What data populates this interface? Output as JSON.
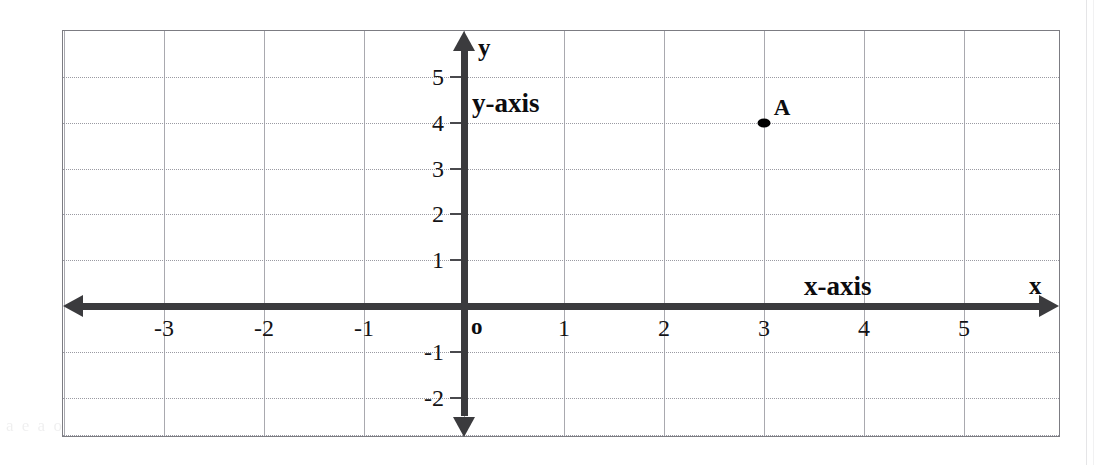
{
  "chart_data": {
    "type": "scatter",
    "title": "",
    "xlabel": "x-axis",
    "ylabel": "y-axis",
    "x_axis_letter": "x",
    "y_axis_letter": "y",
    "origin_label": "o",
    "xlim": [
      -4,
      5.9
    ],
    "ylim": [
      -2.85,
      5.9
    ],
    "grid": true,
    "legend": false,
    "x_ticks": [
      {
        "value": -3,
        "label": "-3"
      },
      {
        "value": -2,
        "label": "-2"
      },
      {
        "value": -1,
        "label": "-1"
      },
      {
        "value": 1,
        "label": "1"
      },
      {
        "value": 2,
        "label": "2"
      },
      {
        "value": 3,
        "label": "3"
      },
      {
        "value": 4,
        "label": "4"
      },
      {
        "value": 5,
        "label": "5"
      }
    ],
    "y_ticks": [
      {
        "value": 5,
        "label": "5"
      },
      {
        "value": 4,
        "label": "4"
      },
      {
        "value": 3,
        "label": "3"
      },
      {
        "value": 2,
        "label": "2"
      },
      {
        "value": 1,
        "label": "1"
      },
      {
        "value": -1,
        "label": "-1"
      },
      {
        "value": -2,
        "label": "-2"
      }
    ],
    "x_gridlines": [
      -4,
      -3,
      -2,
      -1,
      0,
      1,
      2,
      3,
      4,
      5
    ],
    "y_gridlines": [
      5,
      4,
      3,
      2,
      1,
      -1,
      -2
    ],
    "points": [
      {
        "label": "A",
        "x": 3,
        "y": 4
      }
    ],
    "colors": {
      "axis": "#3b3b3e",
      "vertical_grid": "#a9a9af",
      "horizontal_grid": "#9a9aa2",
      "frame": "#7c7c82",
      "point": "#000000",
      "text": "#0c0c0f",
      "background": "#ffffff"
    }
  },
  "scan_artifacts": {
    "bottom_text": "a e  a     o     t  a  a   e   e    t"
  }
}
